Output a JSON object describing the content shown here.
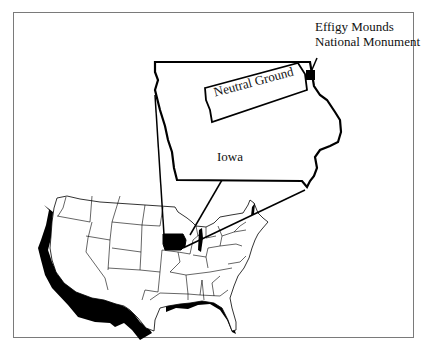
{
  "labels": {
    "monument_line1": "Effigy Mounds",
    "monument_line2": "National Monument",
    "region": "Neutral Ground",
    "state": "Iowa"
  },
  "colors": {
    "ink": "#000000",
    "frame": "#7a7a7a",
    "background": "#ffffff"
  }
}
